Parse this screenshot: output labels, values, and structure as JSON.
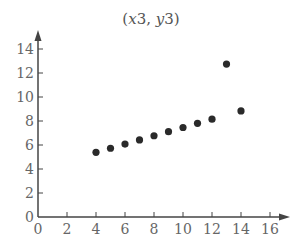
{
  "chart_data": {
    "type": "scatter",
    "title": "(x3, y3)",
    "title_parts": {
      "open": "(",
      "x": "x",
      "x_num": "3",
      "sep": ", ",
      "y": "y",
      "y_num": "3",
      "close": ")"
    },
    "xlabel": "",
    "ylabel": "",
    "xlim": [
      0,
      17
    ],
    "ylim": [
      0,
      15.5
    ],
    "xticks": [
      0,
      2,
      4,
      6,
      8,
      10,
      12,
      14,
      16
    ],
    "yticks": [
      0,
      2,
      4,
      6,
      8,
      10,
      12,
      14
    ],
    "grid": false,
    "legend": null,
    "series": [
      {
        "name": "(x3, y3)",
        "x": [
          10,
          8,
          13,
          9,
          11,
          14,
          6,
          4,
          12,
          7,
          5
        ],
        "y": [
          7.46,
          6.77,
          12.74,
          7.11,
          7.81,
          8.84,
          6.08,
          5.39,
          8.15,
          6.42,
          5.73
        ],
        "color": "#2a2a2a"
      }
    ],
    "colors": {
      "axis": "#444444",
      "tick_label": "#666666",
      "point": "#2a2a2a"
    }
  }
}
